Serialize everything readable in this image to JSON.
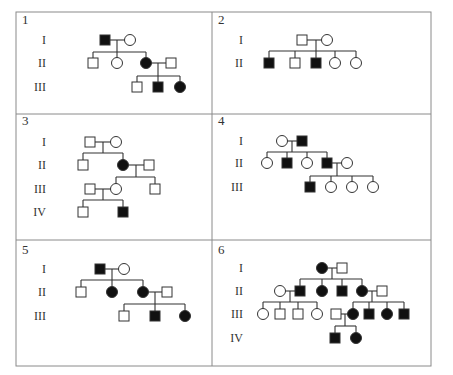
{
  "figure": {
    "table": {
      "left": 16,
      "top": 12,
      "right": 431,
      "bottom": 366,
      "col_split": 212,
      "row_splits": [
        114,
        240
      ],
      "border_color": "#8a8a8a"
    },
    "symbol_size": 10,
    "colors": {
      "affected": "#111111",
      "unaffected_fill": "#ffffff",
      "stroke": "#333333"
    },
    "legend_note": "Square = male, circle = female, filled = affected"
  },
  "panels": [
    {
      "number": "1",
      "num_pos": [
        22,
        24
      ],
      "generations": [
        {
          "label": "I",
          "x": 46,
          "y": 40
        },
        {
          "label": "II",
          "x": 46,
          "y": 63
        },
        {
          "label": "III",
          "x": 46,
          "y": 87
        }
      ],
      "individuals": [
        {
          "id": "I-1",
          "sex": "male",
          "affected": true,
          "x": 105,
          "y": 40
        },
        {
          "id": "I-2",
          "sex": "female",
          "affected": false,
          "x": 130,
          "y": 40
        },
        {
          "id": "II-1",
          "sex": "male",
          "affected": false,
          "x": 93,
          "y": 63
        },
        {
          "id": "II-2",
          "sex": "female",
          "affected": false,
          "x": 117,
          "y": 63
        },
        {
          "id": "II-3",
          "sex": "female",
          "affected": true,
          "x": 146,
          "y": 63
        },
        {
          "id": "II-4",
          "sex": "male",
          "affected": false,
          "x": 171,
          "y": 63
        },
        {
          "id": "III-1",
          "sex": "male",
          "affected": false,
          "x": 137,
          "y": 87
        },
        {
          "id": "III-2",
          "sex": "male",
          "affected": true,
          "x": 158,
          "y": 87
        },
        {
          "id": "III-3",
          "sex": "female",
          "affected": true,
          "x": 180,
          "y": 87
        }
      ],
      "lines": [
        [
          110,
          40,
          125,
          40
        ],
        [
          117,
          40,
          117,
          52
        ],
        [
          93,
          52,
          146,
          52
        ],
        [
          93,
          52,
          93,
          58
        ],
        [
          117,
          52,
          117,
          58
        ],
        [
          146,
          52,
          146,
          58
        ],
        [
          151,
          63,
          166,
          63
        ],
        [
          158,
          63,
          158,
          76
        ],
        [
          137,
          76,
          180,
          76
        ],
        [
          137,
          76,
          137,
          82
        ],
        [
          158,
          76,
          158,
          82
        ],
        [
          180,
          76,
          180,
          82
        ]
      ]
    },
    {
      "number": "2",
      "num_pos": [
        218,
        24
      ],
      "generations": [
        {
          "label": "I",
          "x": 243,
          "y": 40
        },
        {
          "label": "II",
          "x": 243,
          "y": 63
        }
      ],
      "individuals": [
        {
          "id": "I-1",
          "sex": "male",
          "affected": false,
          "x": 302,
          "y": 40
        },
        {
          "id": "I-2",
          "sex": "female",
          "affected": false,
          "x": 327,
          "y": 40
        },
        {
          "id": "II-1",
          "sex": "male",
          "affected": true,
          "x": 269,
          "y": 63
        },
        {
          "id": "II-2",
          "sex": "male",
          "affected": false,
          "x": 295,
          "y": 63
        },
        {
          "id": "II-3",
          "sex": "male",
          "affected": true,
          "x": 316,
          "y": 63
        },
        {
          "id": "II-4",
          "sex": "female",
          "affected": false,
          "x": 335,
          "y": 63
        },
        {
          "id": "II-5",
          "sex": "female",
          "affected": false,
          "x": 356,
          "y": 63
        }
      ],
      "lines": [
        [
          307,
          40,
          322,
          40
        ],
        [
          316,
          40,
          316,
          51
        ],
        [
          269,
          51,
          356,
          51
        ],
        [
          269,
          51,
          269,
          58
        ],
        [
          295,
          51,
          295,
          58
        ],
        [
          316,
          51,
          316,
          58
        ],
        [
          335,
          51,
          335,
          58
        ],
        [
          356,
          51,
          356,
          58
        ]
      ]
    },
    {
      "number": "3",
      "num_pos": [
        22,
        125
      ],
      "generations": [
        {
          "label": "I",
          "x": 46,
          "y": 142
        },
        {
          "label": "II",
          "x": 46,
          "y": 165
        },
        {
          "label": "III",
          "x": 46,
          "y": 189
        },
        {
          "label": "IV",
          "x": 46,
          "y": 212
        }
      ],
      "individuals": [
        {
          "id": "I-1",
          "sex": "male",
          "affected": false,
          "x": 90,
          "y": 142
        },
        {
          "id": "I-2",
          "sex": "female",
          "affected": false,
          "x": 116,
          "y": 142
        },
        {
          "id": "II-1",
          "sex": "male",
          "affected": false,
          "x": 83,
          "y": 165
        },
        {
          "id": "II-2",
          "sex": "female",
          "affected": true,
          "x": 123,
          "y": 165
        },
        {
          "id": "II-3",
          "sex": "male",
          "affected": false,
          "x": 149,
          "y": 165
        },
        {
          "id": "III-1",
          "sex": "male",
          "affected": false,
          "x": 90,
          "y": 189
        },
        {
          "id": "III-2",
          "sex": "female",
          "affected": false,
          "x": 116,
          "y": 189
        },
        {
          "id": "III-3",
          "sex": "male",
          "affected": false,
          "x": 155,
          "y": 189
        },
        {
          "id": "IV-1",
          "sex": "male",
          "affected": false,
          "x": 83,
          "y": 212
        },
        {
          "id": "IV-2",
          "sex": "male",
          "affected": true,
          "x": 123,
          "y": 212
        }
      ],
      "lines": [
        [
          95,
          142,
          111,
          142
        ],
        [
          103,
          142,
          103,
          153
        ],
        [
          83,
          153,
          123,
          153
        ],
        [
          83,
          153,
          83,
          160
        ],
        [
          123,
          153,
          123,
          160
        ],
        [
          128,
          165,
          144,
          165
        ],
        [
          136,
          165,
          136,
          177
        ],
        [
          116,
          177,
          155,
          177
        ],
        [
          116,
          177,
          116,
          184
        ],
        [
          155,
          177,
          155,
          184
        ],
        [
          95,
          189,
          111,
          189
        ],
        [
          103,
          189,
          103,
          200
        ],
        [
          83,
          200,
          123,
          200
        ],
        [
          83,
          200,
          83,
          207
        ],
        [
          123,
          200,
          123,
          207
        ]
      ]
    },
    {
      "number": "4",
      "num_pos": [
        218,
        125
      ],
      "generations": [
        {
          "label": "I",
          "x": 243,
          "y": 141
        },
        {
          "label": "II",
          "x": 243,
          "y": 163
        },
        {
          "label": "III",
          "x": 243,
          "y": 187
        }
      ],
      "individuals": [
        {
          "id": "I-1",
          "sex": "female",
          "affected": false,
          "x": 282,
          "y": 141
        },
        {
          "id": "I-2",
          "sex": "male",
          "affected": true,
          "x": 302,
          "y": 141
        },
        {
          "id": "II-1",
          "sex": "female",
          "affected": false,
          "x": 267,
          "y": 163
        },
        {
          "id": "II-2",
          "sex": "male",
          "affected": true,
          "x": 287,
          "y": 163
        },
        {
          "id": "II-3",
          "sex": "female",
          "affected": false,
          "x": 307,
          "y": 163
        },
        {
          "id": "II-4",
          "sex": "male",
          "affected": true,
          "x": 327,
          "y": 163
        },
        {
          "id": "II-5",
          "sex": "female",
          "affected": false,
          "x": 347,
          "y": 163
        },
        {
          "id": "III-1",
          "sex": "male",
          "affected": true,
          "x": 310,
          "y": 187
        },
        {
          "id": "III-2",
          "sex": "female",
          "affected": false,
          "x": 331,
          "y": 187
        },
        {
          "id": "III-3",
          "sex": "female",
          "affected": false,
          "x": 352,
          "y": 187
        },
        {
          "id": "III-4",
          "sex": "female",
          "affected": false,
          "x": 373,
          "y": 187
        }
      ],
      "lines": [
        [
          287,
          141,
          297,
          141
        ],
        [
          292,
          141,
          292,
          152
        ],
        [
          267,
          152,
          327,
          152
        ],
        [
          267,
          152,
          267,
          158
        ],
        [
          287,
          152,
          287,
          158
        ],
        [
          307,
          152,
          307,
          158
        ],
        [
          327,
          152,
          327,
          158
        ],
        [
          332,
          163,
          342,
          163
        ],
        [
          337,
          163,
          337,
          176
        ],
        [
          310,
          176,
          373,
          176
        ],
        [
          310,
          176,
          310,
          182
        ],
        [
          331,
          176,
          331,
          182
        ],
        [
          352,
          176,
          352,
          182
        ],
        [
          373,
          176,
          373,
          182
        ]
      ]
    },
    {
      "number": "5",
      "num_pos": [
        22,
        254
      ],
      "generations": [
        {
          "label": "I",
          "x": 46,
          "y": 269
        },
        {
          "label": "II",
          "x": 46,
          "y": 292
        },
        {
          "label": "III",
          "x": 46,
          "y": 316
        }
      ],
      "individuals": [
        {
          "id": "I-1",
          "sex": "male",
          "affected": true,
          "x": 100,
          "y": 269
        },
        {
          "id": "I-2",
          "sex": "female",
          "affected": false,
          "x": 124,
          "y": 269
        },
        {
          "id": "II-1",
          "sex": "male",
          "affected": false,
          "x": 81,
          "y": 292
        },
        {
          "id": "II-2",
          "sex": "female",
          "affected": true,
          "x": 112,
          "y": 292
        },
        {
          "id": "II-3",
          "sex": "female",
          "affected": true,
          "x": 143,
          "y": 292
        },
        {
          "id": "II-4",
          "sex": "male",
          "affected": false,
          "x": 167,
          "y": 292
        },
        {
          "id": "III-1",
          "sex": "male",
          "affected": false,
          "x": 124,
          "y": 316
        },
        {
          "id": "III-2",
          "sex": "male",
          "affected": true,
          "x": 155,
          "y": 316
        },
        {
          "id": "III-3",
          "sex": "female",
          "affected": true,
          "x": 185,
          "y": 316
        }
      ],
      "lines": [
        [
          105,
          269,
          119,
          269
        ],
        [
          112,
          269,
          112,
          280
        ],
        [
          81,
          280,
          143,
          280
        ],
        [
          81,
          280,
          81,
          287
        ],
        [
          112,
          280,
          112,
          287
        ],
        [
          143,
          280,
          143,
          287
        ],
        [
          148,
          292,
          162,
          292
        ],
        [
          155,
          292,
          155,
          304
        ],
        [
          124,
          304,
          185,
          304
        ],
        [
          124,
          304,
          124,
          311
        ],
        [
          155,
          304,
          155,
          311
        ],
        [
          185,
          304,
          185,
          311
        ]
      ]
    },
    {
      "number": "6",
      "num_pos": [
        218,
        254
      ],
      "generations": [
        {
          "label": "I",
          "x": 243,
          "y": 268
        },
        {
          "label": "II",
          "x": 243,
          "y": 291
        },
        {
          "label": "III",
          "x": 243,
          "y": 314
        },
        {
          "label": "IV",
          "x": 243,
          "y": 338
        }
      ],
      "individuals": [
        {
          "id": "I-1",
          "sex": "female",
          "affected": true,
          "x": 322,
          "y": 268
        },
        {
          "id": "I-2",
          "sex": "male",
          "affected": false,
          "x": 342,
          "y": 268
        },
        {
          "id": "II-1",
          "sex": "female",
          "affected": false,
          "x": 280,
          "y": 291
        },
        {
          "id": "II-2",
          "sex": "male",
          "affected": true,
          "x": 300,
          "y": 291
        },
        {
          "id": "II-3",
          "sex": "female",
          "affected": true,
          "x": 322,
          "y": 291
        },
        {
          "id": "II-4",
          "sex": "male",
          "affected": true,
          "x": 342,
          "y": 291
        },
        {
          "id": "II-5",
          "sex": "female",
          "affected": true,
          "x": 362,
          "y": 291
        },
        {
          "id": "II-6",
          "sex": "male",
          "affected": false,
          "x": 382,
          "y": 291
        },
        {
          "id": "III-1",
          "sex": "female",
          "affected": false,
          "x": 263,
          "y": 314
        },
        {
          "id": "III-2",
          "sex": "male",
          "affected": false,
          "x": 280,
          "y": 314
        },
        {
          "id": "III-3",
          "sex": "male",
          "affected": false,
          "x": 298,
          "y": 314
        },
        {
          "id": "III-4",
          "sex": "female",
          "affected": false,
          "x": 317,
          "y": 314
        },
        {
          "id": "III-5",
          "sex": "male",
          "affected": false,
          "x": 336,
          "y": 314
        },
        {
          "id": "III-6",
          "sex": "female",
          "affected": true,
          "x": 353,
          "y": 314
        },
        {
          "id": "III-7",
          "sex": "male",
          "affected": true,
          "x": 369,
          "y": 314
        },
        {
          "id": "III-8",
          "sex": "female",
          "affected": true,
          "x": 387,
          "y": 314
        },
        {
          "id": "III-9",
          "sex": "male",
          "affected": true,
          "x": 404,
          "y": 314
        },
        {
          "id": "IV-1",
          "sex": "male",
          "affected": true,
          "x": 335,
          "y": 338
        },
        {
          "id": "IV-2",
          "sex": "female",
          "affected": true,
          "x": 356,
          "y": 338
        }
      ],
      "lines": [
        [
          327,
          268,
          337,
          268
        ],
        [
          332,
          268,
          332,
          279
        ],
        [
          300,
          279,
          362,
          279
        ],
        [
          300,
          279,
          300,
          286
        ],
        [
          322,
          279,
          322,
          286
        ],
        [
          342,
          279,
          342,
          286
        ],
        [
          362,
          279,
          362,
          286
        ],
        [
          285,
          291,
          295,
          291
        ],
        [
          290,
          291,
          290,
          302
        ],
        [
          263,
          302,
          317,
          302
        ],
        [
          263,
          302,
          263,
          309
        ],
        [
          280,
          302,
          280,
          309
        ],
        [
          298,
          302,
          298,
          309
        ],
        [
          317,
          302,
          317,
          309
        ],
        [
          367,
          291,
          377,
          291
        ],
        [
          372,
          291,
          372,
          302
        ],
        [
          353,
          302,
          404,
          302
        ],
        [
          353,
          302,
          353,
          309
        ],
        [
          369,
          302,
          369,
          309
        ],
        [
          387,
          302,
          387,
          309
        ],
        [
          404,
          302,
          404,
          309
        ],
        [
          341,
          314,
          348,
          314
        ],
        [
          345,
          314,
          345,
          326
        ],
        [
          335,
          326,
          356,
          326
        ],
        [
          335,
          326,
          335,
          333
        ],
        [
          356,
          326,
          356,
          333
        ]
      ]
    }
  ]
}
